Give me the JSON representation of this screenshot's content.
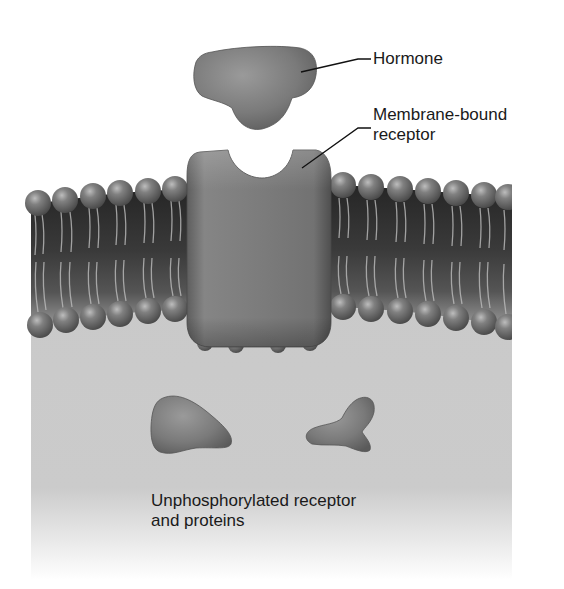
{
  "figure": {
    "labels": {
      "hormone": "Hormone",
      "receptor_line1": "Membrane-bound",
      "receptor_line2": "receptor",
      "unphos_line1": "Unphosphorylated receptor",
      "unphos_line2": "and proteins"
    },
    "components": [
      "hormone",
      "membrane-bound receptor",
      "lipid bilayer",
      "unphosphorylated protein A",
      "unphosphorylated protein B"
    ],
    "colors": {
      "background": "#ffffff",
      "cytoplasm": "#c9c9c9",
      "membrane_core": "#2e2e2e",
      "protein_fill": "#7d7d7d",
      "lipid_head": "#6f6f6f",
      "label_text": "#1a1a1a"
    }
  }
}
